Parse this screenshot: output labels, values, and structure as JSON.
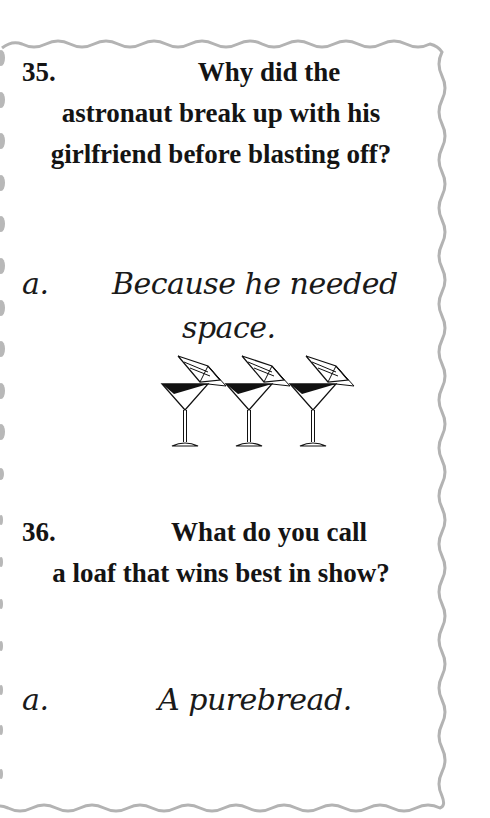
{
  "card": {
    "border_color": "#b3b3b3",
    "items": [
      {
        "number": "35.",
        "question_line1": "Why did the",
        "question_rest": "astronaut break up with his girlfriend before blasting off?",
        "answer_letter": "a.",
        "answer_line1": "Because he needed",
        "answer_line2": "space."
      },
      {
        "number": "36.",
        "question_line1": "What do you call",
        "question_rest": "a loaf that wins best in show?",
        "answer_letter": "a.",
        "answer_text": "A purebread."
      }
    ],
    "decoration": {
      "icon": "martini-glass-with-umbrella-icon",
      "count": 3
    }
  }
}
